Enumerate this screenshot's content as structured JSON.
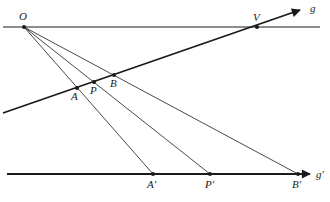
{
  "diagram": {
    "type": "geometric-construction",
    "lines": {
      "top": {
        "x1": 3,
        "y1": 27,
        "x2": 320,
        "y2": 27,
        "width": 1.2
      },
      "g": {
        "x1": 3,
        "y1": 113,
        "x2": 300,
        "y2": 10,
        "width": 1.8,
        "label": "g",
        "label_x": 310,
        "label_y": 12
      },
      "g_prime": {
        "x1": 7,
        "y1": 174,
        "x2": 310,
        "y2": 174,
        "width": 1.8,
        "label": "g′",
        "label_x": 316,
        "label_y": 178
      }
    },
    "points": {
      "O": {
        "label": "O",
        "x": 24,
        "y": 27,
        "lx": 19,
        "ly": 20
      },
      "V": {
        "label": "V",
        "x": 257,
        "y": 27,
        "lx": 253,
        "ly": 21
      },
      "A": {
        "label": "A",
        "x": 77,
        "y": 88,
        "lx": 71,
        "ly": 100
      },
      "P": {
        "label": "P",
        "x": 94,
        "y": 82,
        "lx": 90,
        "ly": 94
      },
      "B": {
        "label": "B",
        "x": 114,
        "y": 75,
        "lx": 110,
        "ly": 87
      },
      "A_prime": {
        "label": "A′",
        "x": 153,
        "y": 174,
        "lx": 147,
        "ly": 188
      },
      "P_prime": {
        "label": "P′",
        "x": 210,
        "y": 174,
        "lx": 205,
        "ly": 188
      },
      "B_prime": {
        "label": "B′",
        "x": 298,
        "y": 174,
        "lx": 292,
        "ly": 188
      }
    },
    "rays_from_O": [
      "A_prime",
      "P_prime",
      "B_prime"
    ],
    "stroke_color": "#1a1a1a"
  }
}
